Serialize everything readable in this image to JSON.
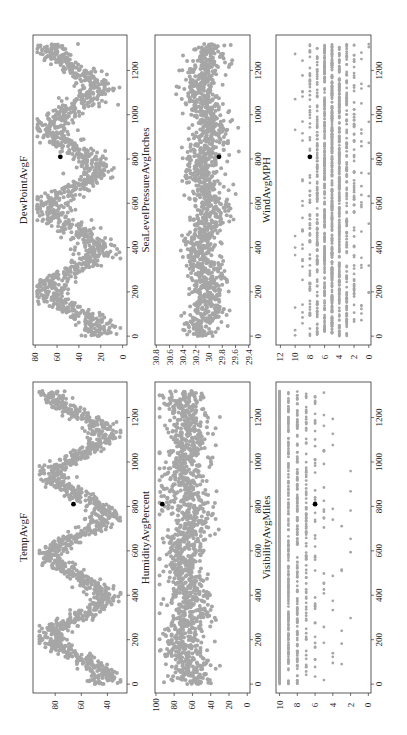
{
  "figure": {
    "layout": "3 columns x 2 rows of scatter panels, rotated 90 degrees counter-clockwise",
    "point_color": "#a6a6a6",
    "highlight_color": "#000000",
    "frame_color": "#333333"
  },
  "chart_data": [
    {
      "type": "scatter",
      "title": "DewPointAvgF",
      "xlabel": "",
      "ylabel": "",
      "x_ticks": [
        0,
        200,
        400,
        600,
        800,
        1000,
        1200
      ],
      "y_ticks": [
        0,
        20,
        40,
        60,
        80
      ],
      "xlim": [
        -40,
        1360
      ],
      "ylim": [
        -4,
        82
      ],
      "pattern": "seasonal sinusoid, peaks ~70 near x=250,600,950,1300; troughs ~15 near x=30,420,780,1110",
      "model": {
        "kind": "seasonal",
        "base": 45,
        "amp": 22,
        "period": 365,
        "phase": 120,
        "noise": 9,
        "min": 2,
        "max": 78
      },
      "highlight": {
        "x": 810,
        "y": 57
      },
      "grid": false,
      "panel": {
        "left": 33,
        "top": 35,
        "right": 127,
        "bottom": 345
      }
    },
    {
      "type": "scatter",
      "title": "SeaLevelPressureAvgInches",
      "xlabel": "",
      "ylabel": "",
      "x_ticks": [
        0,
        200,
        400,
        600,
        800,
        1000,
        1200
      ],
      "y_ticks": [
        29.4,
        29.6,
        29.8,
        30.0,
        30.2,
        30.4,
        30.6,
        30.8
      ],
      "xlim": [
        -40,
        1360
      ],
      "ylim": [
        29.38,
        30.82
      ],
      "pattern": "centered ~30.0-30.1, wider spread in winter",
      "model": {
        "kind": "seasonal",
        "base": 30.05,
        "amp": -0.08,
        "period": 365,
        "phase": 120,
        "noise": 0.14,
        "min": 29.55,
        "max": 30.72
      },
      "highlight": {
        "x": 810,
        "y": 29.85
      },
      "grid": false,
      "panel": {
        "left": 155,
        "top": 35,
        "right": 250,
        "bottom": 345
      }
    },
    {
      "type": "scatter",
      "title": "WindAvgMPH",
      "xlabel": "",
      "ylabel": "",
      "x_ticks": [
        0,
        200,
        400,
        600,
        800,
        1000,
        1200
      ],
      "y_ticks": [
        0,
        2,
        4,
        6,
        8,
        10,
        12
      ],
      "xlim": [
        -40,
        1360
      ],
      "ylim": [
        -0.3,
        12.6
      ],
      "pattern": "integer-valued bands, dense at 3-7, sparse at 1-2 and 9-12",
      "model": {
        "kind": "discrete",
        "base": 5,
        "noise": 1.8,
        "min": 0,
        "max": 12,
        "integer": true
      },
      "highlight": {
        "x": 810,
        "y": 8
      },
      "grid": false,
      "panel": {
        "left": 276,
        "top": 35,
        "right": 371,
        "bottom": 345
      }
    },
    {
      "type": "scatter",
      "title": "TempAvgF",
      "xlabel": "",
      "ylabel": "",
      "x_ticks": [
        0,
        200,
        400,
        600,
        800,
        1000,
        1200
      ],
      "y_ticks": [
        40,
        60,
        80
      ],
      "xlim": [
        -40,
        1360
      ],
      "ylim": [
        25,
        97
      ],
      "pattern": "seasonal sinusoid, peaks ~88 near summer, troughs ~35 in winter",
      "model": {
        "kind": "seasonal",
        "base": 62,
        "amp": 20,
        "period": 365,
        "phase": 120,
        "noise": 6,
        "min": 30,
        "max": 92
      },
      "highlight": {
        "x": 810,
        "y": 66
      },
      "grid": false,
      "panel": {
        "left": 33,
        "top": 382,
        "right": 127,
        "bottom": 693
      }
    },
    {
      "type": "scatter",
      "title": "HumidityAvgPercent",
      "xlabel": "",
      "ylabel": "",
      "x_ticks": [
        0,
        200,
        400,
        600,
        800,
        1000,
        1200
      ],
      "y_ticks": [
        0,
        20,
        40,
        60,
        80,
        100
      ],
      "xlim": [
        -40,
        1360
      ],
      "ylim": [
        -3,
        101
      ],
      "pattern": "mostly 45-90 percent, median ~65",
      "model": {
        "kind": "seasonal",
        "base": 66,
        "amp": 4,
        "period": 365,
        "phase": 120,
        "noise": 12,
        "min": 30,
        "max": 96
      },
      "highlight": {
        "x": 810,
        "y": 93
      },
      "grid": false,
      "panel": {
        "left": 155,
        "top": 382,
        "right": 250,
        "bottom": 693
      }
    },
    {
      "type": "scatter",
      "title": "VisibilityAvgMiles",
      "xlabel": "",
      "ylabel": "",
      "x_ticks": [
        0,
        200,
        400,
        600,
        800,
        1000,
        1200
      ],
      "y_ticks": [
        0,
        2,
        4,
        6,
        8,
        10
      ],
      "xlim": [
        -40,
        1360
      ],
      "ylim": [
        -0.3,
        10.4
      ],
      "pattern": "integer-valued, solid band at 10, decreasing density down to 2",
      "model": {
        "kind": "visibility",
        "min": 0,
        "max": 10,
        "integer": true
      },
      "highlight": {
        "x": 810,
        "y": 6
      },
      "grid": false,
      "panel": {
        "left": 276,
        "top": 382,
        "right": 371,
        "bottom": 693
      }
    }
  ]
}
